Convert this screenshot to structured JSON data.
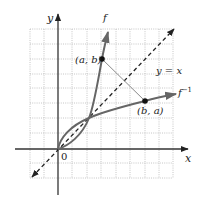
{
  "figure": {
    "colors": {
      "background": "#ffffff",
      "grid": "#b8b8b8",
      "axes": "#333333",
      "curve": "#666666",
      "diagonal": "#222222",
      "connector": "#8a8a8a",
      "point": "#111111"
    },
    "axes": {
      "x_label": "x",
      "y_label": "y",
      "origin_label": "0"
    },
    "curves": [
      {
        "id": "f",
        "label": "f"
      },
      {
        "id": "f_inverse",
        "label": "f",
        "superscript": "−1"
      }
    ],
    "reference_line": {
      "label": "y = x",
      "style": "dashed",
      "arrows": "both"
    },
    "points": [
      {
        "id": "point-a-b",
        "label": "(a, b)"
      },
      {
        "id": "point-b-a",
        "label": "(b, a)"
      }
    ],
    "grid": {
      "style": "dotted",
      "cols": 10,
      "rows": 10
    }
  }
}
